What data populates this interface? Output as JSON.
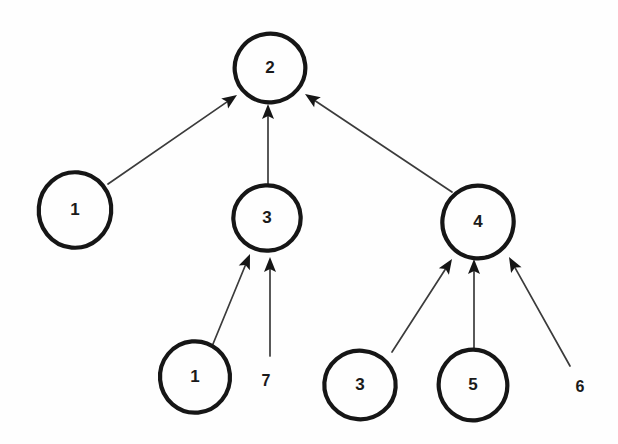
{
  "diagram": {
    "type": "directed-tree",
    "background_color": "#fefefe",
    "node_stroke_color": "#161616",
    "node_fill_color": "#fefefe",
    "edge_color": "#3b3b3b",
    "text_color": "#1a1a1a",
    "nodes": [
      {
        "id": "root",
        "label": "2",
        "cx": 270,
        "cy": 68,
        "r": 35
      },
      {
        "id": "left1",
        "label": "1",
        "cx": 75,
        "cy": 210,
        "r": 37
      },
      {
        "id": "mid3",
        "label": "3",
        "cx": 267,
        "cy": 218,
        "r": 33
      },
      {
        "id": "right4",
        "label": "4",
        "cx": 478,
        "cy": 222,
        "r": 36
      },
      {
        "id": "leaf1",
        "label": "1",
        "cx": 195,
        "cy": 377,
        "r": 35
      },
      {
        "id": "leaf3",
        "label": "3",
        "cx": 360,
        "cy": 385,
        "r": 35
      },
      {
        "id": "leaf5",
        "label": "5",
        "cx": 473,
        "cy": 385,
        "r": 35
      }
    ],
    "leaf_labels": [
      {
        "id": "label7",
        "label": "7",
        "x": 266,
        "y": 382
      },
      {
        "id": "label6",
        "label": "6",
        "x": 580,
        "y": 388
      }
    ],
    "edges": [
      {
        "id": "e-left1-root",
        "from": "left1",
        "to": "root",
        "x1": 108,
        "y1": 184,
        "x2": 237,
        "y2": 95
      },
      {
        "id": "e-mid3-root",
        "from": "mid3",
        "to": "root",
        "x1": 268,
        "y1": 185,
        "x2": 268,
        "y2": 104
      },
      {
        "id": "e-right4-root",
        "from": "right4",
        "to": "root",
        "x1": 452,
        "y1": 192,
        "x2": 305,
        "y2": 94
      },
      {
        "id": "e-leaf1-mid3",
        "from": "leaf1",
        "to": "mid3",
        "x1": 213,
        "y1": 344,
        "x2": 250,
        "y2": 254
      },
      {
        "id": "e-label7-mid3",
        "from": "label7",
        "to": "mid3",
        "x1": 270,
        "y1": 356,
        "x2": 270,
        "y2": 257
      },
      {
        "id": "e-leaf3-right4",
        "from": "leaf3",
        "to": "right4",
        "x1": 392,
        "y1": 352,
        "x2": 452,
        "y2": 259
      },
      {
        "id": "e-leaf5-right4",
        "from": "leaf5",
        "to": "right4",
        "x1": 474,
        "y1": 350,
        "x2": 474,
        "y2": 259
      },
      {
        "id": "e-label6-right4",
        "from": "label6",
        "to": "right4",
        "x1": 570,
        "y1": 366,
        "x2": 509,
        "y2": 257
      }
    ]
  }
}
